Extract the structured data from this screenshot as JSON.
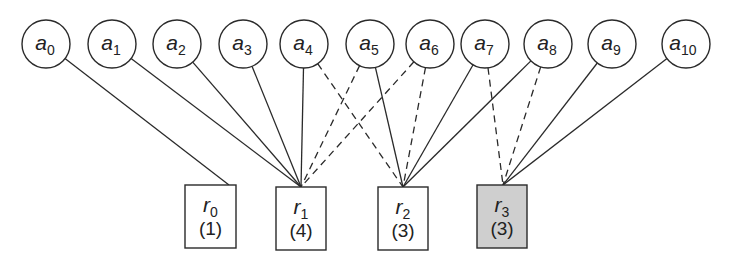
{
  "diagram": {
    "top_nodes": [
      {
        "id": "a0",
        "base": "a",
        "sub": "0",
        "cx": 46,
        "cy": 44
      },
      {
        "id": "a1",
        "base": "a",
        "sub": "1",
        "cx": 112,
        "cy": 44
      },
      {
        "id": "a2",
        "base": "a",
        "sub": "2",
        "cx": 177,
        "cy": 44
      },
      {
        "id": "a3",
        "base": "a",
        "sub": "3",
        "cx": 243,
        "cy": 44
      },
      {
        "id": "a4",
        "base": "a",
        "sub": "4",
        "cx": 304,
        "cy": 44
      },
      {
        "id": "a5",
        "base": "a",
        "sub": "5",
        "cx": 370,
        "cy": 44
      },
      {
        "id": "a6",
        "base": "a",
        "sub": "6",
        "cx": 430,
        "cy": 44
      },
      {
        "id": "a7",
        "base": "a",
        "sub": "7",
        "cx": 485,
        "cy": 44
      },
      {
        "id": "a8",
        "base": "a",
        "sub": "8",
        "cx": 548,
        "cy": 44
      },
      {
        "id": "a9",
        "base": "a",
        "sub": "9",
        "cx": 612,
        "cy": 44
      },
      {
        "id": "a10",
        "base": "a",
        "sub": "10",
        "cx": 686,
        "cy": 44
      }
    ],
    "bottom_nodes": [
      {
        "id": "r0",
        "base": "r",
        "sub": "0",
        "count": "(1)",
        "x": 185,
        "y": 185,
        "w": 51,
        "h": 63,
        "fill": "#ffffff",
        "anchor_x": 229,
        "anchor_y": 185
      },
      {
        "id": "r1",
        "base": "r",
        "sub": "1",
        "count": "(4)",
        "x": 276,
        "y": 187,
        "w": 50,
        "h": 63,
        "fill": "#ffffff",
        "anchor_x": 301,
        "anchor_y": 187
      },
      {
        "id": "r2",
        "base": "r",
        "sub": "2",
        "count": "(3)",
        "x": 378,
        "y": 187,
        "w": 50,
        "h": 63,
        "fill": "#ffffff",
        "anchor_x": 403,
        "anchor_y": 187
      },
      {
        "id": "r3",
        "base": "r",
        "sub": "3",
        "count": "(3)",
        "x": 477,
        "y": 185,
        "w": 50,
        "h": 63,
        "fill": "#cfcfcf",
        "anchor_x": 503,
        "anchor_y": 185
      }
    ],
    "edges": [
      {
        "from": "a0",
        "to": "r0",
        "style": "solid"
      },
      {
        "from": "a1",
        "to": "r1",
        "style": "solid"
      },
      {
        "from": "a2",
        "to": "r1",
        "style": "solid"
      },
      {
        "from": "a3",
        "to": "r1",
        "style": "solid"
      },
      {
        "from": "a4",
        "to": "r1",
        "style": "solid"
      },
      {
        "from": "a5",
        "to": "r1",
        "style": "dashed"
      },
      {
        "from": "a6",
        "to": "r1",
        "style": "dashed"
      },
      {
        "from": "a4",
        "to": "r2",
        "style": "dashed"
      },
      {
        "from": "a5",
        "to": "r2",
        "style": "solid"
      },
      {
        "from": "a6",
        "to": "r2",
        "style": "dashed"
      },
      {
        "from": "a7",
        "to": "r2",
        "style": "solid"
      },
      {
        "from": "a8",
        "to": "r2",
        "style": "solid"
      },
      {
        "from": "a7",
        "to": "r3",
        "style": "dashed"
      },
      {
        "from": "a8",
        "to": "r3",
        "style": "dashed"
      },
      {
        "from": "a9",
        "to": "r3",
        "style": "solid"
      },
      {
        "from": "a10",
        "to": "r3",
        "style": "solid"
      }
    ],
    "node_radius": 24,
    "colors": {
      "stroke": "#2a2a2a",
      "highlight_fill": "#cfcfcf",
      "background": "#ffffff"
    }
  }
}
